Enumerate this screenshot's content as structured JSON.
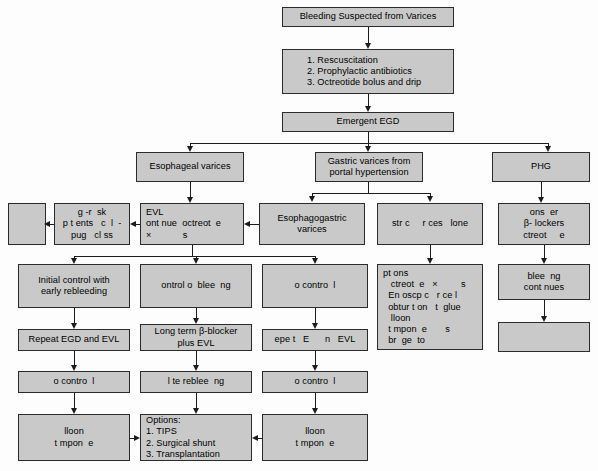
{
  "diagram": {
    "box_fill": "#c9c9c9",
    "box_stroke": "#2b2b2b",
    "connector_color": "#1c1c1c",
    "background": "#fdfdfd"
  },
  "nodes": {
    "root": {
      "label": "Bleeding Suspected from Varices"
    },
    "initial_measures": {
      "line1": "1. Rescuscitation",
      "line2": "2. Prophylactic antibiotics",
      "line3": "3. Octreotide bolus and drip"
    },
    "emergent_egd": {
      "label": "Emergent EGD"
    },
    "esophageal_varices": {
      "label": "Esophageal varices"
    },
    "gastric_varices": {
      "line1": "Gastric varices from",
      "line2": "portal hypertension"
    },
    "phg": {
      "label": "PHG"
    },
    "blank_far_left": {
      "label": ""
    },
    "high_risk": {
      "line1": "g -r  sk",
      "line2": "p t ents   c  l  -",
      "line3": "pug   cl ss"
    },
    "evl": {
      "line1": "EVL",
      "line2": "ont nue  octreot  e",
      "line3": "×            s"
    },
    "esophagogastric_varices": {
      "line1": "Esophagogastric",
      "line2": "varices"
    },
    "gastric_alone": {
      "label": "str c     r ces   lone"
    },
    "phg_consider": {
      "line1": "ons  er",
      "line2": "β- lockers",
      "line3": "ctreot     e"
    },
    "initial_control": {
      "line1": "Initial control with",
      "line2": "early rebleeding"
    },
    "control_of_bleeding": {
      "label": "ontrol o  blee  ng"
    },
    "no_control_1": {
      "label": "o contro  l"
    },
    "gastric_options": {
      "line1": "pt ons",
      "line2": "   ctreot  e   ×         s",
      "line3": "  En oscp c   r ce l",
      "line4": "  obtur t on   t  glue",
      "line5": "   lloon",
      "line6": "  t mpon  e       s",
      "line7": "  br  ge  to"
    },
    "bleeding_continues": {
      "line1": "blee  ng",
      "line2": "cont nues"
    },
    "repeat_egd_evl": {
      "label": "Repeat EGD and EVL"
    },
    "long_term_bblocker": {
      "line1": "Long term β-blocker",
      "line2": "plus EVL"
    },
    "repeat_egd_evl_2": {
      "label": "epe t   E      n   EVL"
    },
    "phg_blank": {
      "label": ""
    },
    "no_control_2": {
      "label": "o contro  l"
    },
    "late_rebleeding": {
      "label": "l te reblee  ng"
    },
    "no_control_3": {
      "label": "o contro  l"
    },
    "balloon_tamponade_left": {
      "line1": "lloon",
      "line2": "t mpon  e"
    },
    "options_salvage": {
      "line1": "Options:",
      "line2": "1. TIPS",
      "line3": "2. Surgical shunt",
      "line4": "3. Transplantation"
    },
    "balloon_tamponade_right": {
      "line1": "lloon",
      "line2": "t mpon  e"
    }
  }
}
